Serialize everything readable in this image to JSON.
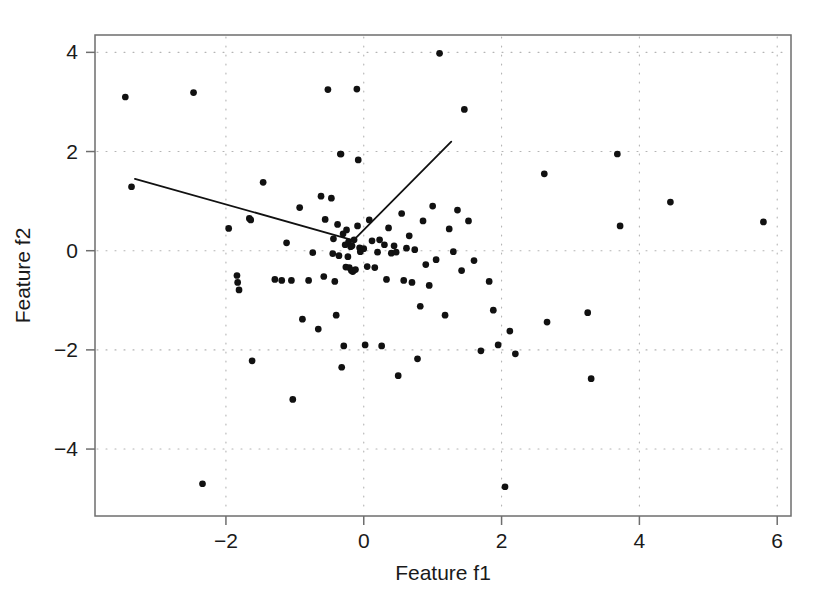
{
  "chart_data": {
    "type": "scatter",
    "title": "",
    "xlabel": "Feature f1",
    "ylabel": "Feature f2",
    "xlim": [
      -3.9,
      6.2
    ],
    "ylim": [
      -5.35,
      4.35
    ],
    "xticks": [
      -2,
      0,
      2,
      4,
      6
    ],
    "xtick_labels": [
      "−2",
      "0",
      "2",
      "4",
      "6"
    ],
    "yticks": [
      -4,
      -2,
      0,
      2,
      4
    ],
    "ytick_labels": [
      "−4",
      "−2",
      "0",
      "2",
      "4"
    ],
    "grid": true,
    "grid_style": "dotted",
    "grid_color": "#b4b4b4",
    "legend": "none",
    "marker": "filled-circle",
    "marker_color": "#111111",
    "marker_size": 5.2,
    "point_count": 108,
    "points": [
      [
        -3.46,
        3.1
      ],
      [
        -3.37,
        1.29
      ],
      [
        -2.47,
        3.19
      ],
      [
        -2.34,
        -4.7
      ],
      [
        -1.96,
        0.45
      ],
      [
        -1.84,
        -0.5
      ],
      [
        -1.83,
        -0.64
      ],
      [
        -1.81,
        -0.79
      ],
      [
        -1.66,
        0.65
      ],
      [
        -1.64,
        0.62
      ],
      [
        -1.62,
        -2.22
      ],
      [
        -1.46,
        1.38
      ],
      [
        -1.29,
        -0.58
      ],
      [
        -1.19,
        -0.6
      ],
      [
        -1.12,
        0.16
      ],
      [
        -1.05,
        -0.6
      ],
      [
        -1.03,
        -3.0
      ],
      [
        -0.93,
        0.87
      ],
      [
        -0.89,
        -1.38
      ],
      [
        -0.8,
        -0.6
      ],
      [
        -0.74,
        -0.04
      ],
      [
        -0.66,
        -1.58
      ],
      [
        -0.62,
        1.1
      ],
      [
        -0.58,
        -0.52
      ],
      [
        -0.56,
        0.63
      ],
      [
        -0.52,
        3.25
      ],
      [
        -0.47,
        1.06
      ],
      [
        -0.45,
        -0.06
      ],
      [
        -0.44,
        0.24
      ],
      [
        -0.42,
        -0.62
      ],
      [
        -0.4,
        -1.3
      ],
      [
        -0.38,
        0.53
      ],
      [
        -0.36,
        -0.1
      ],
      [
        -0.34,
        1.95
      ],
      [
        -0.33,
        1.95
      ],
      [
        -0.32,
        -2.35
      ],
      [
        -0.3,
        0.34
      ],
      [
        -0.29,
        -1.92
      ],
      [
        -0.27,
        0.12
      ],
      [
        -0.26,
        -0.33
      ],
      [
        -0.25,
        0.42
      ],
      [
        -0.23,
        -0.12
      ],
      [
        -0.22,
        0.18
      ],
      [
        -0.21,
        -0.34
      ],
      [
        -0.19,
        0.08
      ],
      [
        -0.18,
        -0.4
      ],
      [
        -0.17,
        0.1
      ],
      [
        -0.16,
        -0.42
      ],
      [
        -0.15,
        -0.4
      ],
      [
        -0.14,
        0.22
      ],
      [
        -0.12,
        -0.38
      ],
      [
        -0.1,
        3.26
      ],
      [
        -0.09,
        0.5
      ],
      [
        -0.08,
        1.83
      ],
      [
        -0.06,
        0.06
      ],
      [
        -0.05,
        -0.02
      ],
      [
        0.0,
        0.04
      ],
      [
        0.02,
        -1.9
      ],
      [
        0.05,
        -0.32
      ],
      [
        0.08,
        0.62
      ],
      [
        0.12,
        0.2
      ],
      [
        0.16,
        -0.34
      ],
      [
        0.2,
        -0.03
      ],
      [
        0.23,
        0.22
      ],
      [
        0.26,
        -1.92
      ],
      [
        0.3,
        0.12
      ],
      [
        0.33,
        -0.58
      ],
      [
        0.36,
        0.46
      ],
      [
        0.4,
        -0.05
      ],
      [
        0.44,
        0.1
      ],
      [
        0.47,
        -0.03
      ],
      [
        0.5,
        -2.52
      ],
      [
        0.55,
        0.75
      ],
      [
        0.58,
        -0.6
      ],
      [
        0.62,
        0.05
      ],
      [
        0.66,
        0.3
      ],
      [
        0.7,
        -0.64
      ],
      [
        0.74,
        0.02
      ],
      [
        0.78,
        -2.18
      ],
      [
        0.82,
        -1.12
      ],
      [
        0.86,
        0.6
      ],
      [
        0.9,
        -0.28
      ],
      [
        0.95,
        -0.7
      ],
      [
        1.0,
        0.9
      ],
      [
        1.05,
        -0.18
      ],
      [
        1.1,
        3.98
      ],
      [
        1.18,
        -1.3
      ],
      [
        1.24,
        0.44
      ],
      [
        1.3,
        -0.02
      ],
      [
        1.36,
        0.82
      ],
      [
        1.42,
        -0.4
      ],
      [
        1.46,
        2.85
      ],
      [
        1.52,
        0.6
      ],
      [
        1.6,
        -0.2
      ],
      [
        1.7,
        -2.02
      ],
      [
        1.82,
        -0.62
      ],
      [
        1.88,
        -1.2
      ],
      [
        1.95,
        -1.9
      ],
      [
        2.05,
        -4.76
      ],
      [
        2.12,
        -1.62
      ],
      [
        2.2,
        -2.08
      ],
      [
        2.62,
        1.55
      ],
      [
        2.66,
        -1.44
      ],
      [
        3.25,
        -1.25
      ],
      [
        3.3,
        -2.58
      ],
      [
        3.68,
        1.95
      ],
      [
        3.72,
        0.5
      ],
      [
        4.45,
        0.98
      ],
      [
        5.8,
        0.58
      ]
    ],
    "lines": [
      {
        "name": "principal-axis-1",
        "color": "#111111",
        "width": 1.8,
        "points": [
          [
            -3.32,
            1.45
          ],
          [
            -0.15,
            0.21
          ]
        ]
      },
      {
        "name": "principal-axis-2",
        "color": "#111111",
        "width": 1.8,
        "points": [
          [
            -0.15,
            0.21
          ],
          [
            1.27,
            2.2
          ]
        ]
      }
    ]
  },
  "axes": {
    "frame_color": "#6e6e6e",
    "background": "#ffffff"
  }
}
